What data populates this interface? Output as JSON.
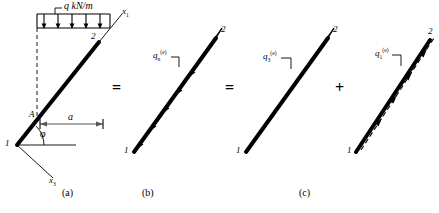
{
  "figure": {
    "type": "structural-mechanics-load-decomposition",
    "panels": [
      {
        "id": "a",
        "caption": "(a)",
        "caption_x": 68,
        "caption_y": 190,
        "load_label": "q kN/m",
        "node_start": "1",
        "node_end": "2",
        "point_label": "A",
        "dimension_label": "a",
        "angle_label": "φ",
        "axis_labels": [
          "x",
          "x"
        ],
        "axis_label_1": "x",
        "axis_sub_1": "1",
        "axis_label_3": "x",
        "axis_sub_3": "3"
      },
      {
        "id": "b",
        "caption": "(b)",
        "caption_x": 148,
        "caption_y": 190,
        "load_symbol": "q",
        "load_sub": "n",
        "load_sup": "(e)",
        "node_start": "1",
        "node_end": "2"
      },
      {
        "id": "c",
        "caption": "(c)",
        "caption_x": 305,
        "caption_y": 190,
        "left_load_symbol": "q",
        "left_load_sub": "3",
        "left_load_sup": "(e)",
        "right_load_symbol": "q",
        "right_load_sub": "1",
        "right_load_sup": "(e)",
        "node_start": "1",
        "node_end": "2"
      }
    ],
    "operators": [
      {
        "name": "equals-1",
        "glyph": "=",
        "x": 112,
        "y": 82
      },
      {
        "name": "equals-2",
        "glyph": "=",
        "x": 225,
        "y": 82
      },
      {
        "name": "plus-1",
        "glyph": "+",
        "x": 335,
        "y": 82
      }
    ],
    "colors": {
      "stroke": "#000000",
      "background": "#ffffff",
      "dimension": "#555555"
    }
  }
}
